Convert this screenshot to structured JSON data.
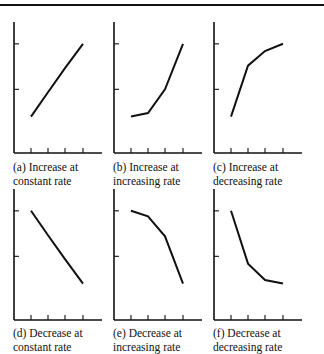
{
  "chart_data": [
    {
      "id": "a",
      "type": "line",
      "caption_line1": "(a) Increase at",
      "caption_line2": "constant rate",
      "x": [
        1,
        2,
        3,
        4
      ],
      "values": [
        1.0,
        1.67,
        2.33,
        3.0
      ],
      "ylim": [
        0,
        3.6
      ],
      "title": "",
      "xlabel": "",
      "ylabel": "",
      "grid": false
    },
    {
      "id": "b",
      "type": "line",
      "caption_line1": "(b) Increase at",
      "caption_line2": "increasing rate",
      "x": [
        1,
        2,
        3,
        4
      ],
      "values": [
        1.0,
        1.1,
        1.75,
        3.0
      ],
      "ylim": [
        0,
        3.6
      ],
      "title": "",
      "xlabel": "",
      "ylabel": "",
      "grid": false
    },
    {
      "id": "c",
      "type": "line",
      "caption_line1": "(c) Increase at",
      "caption_line2": "decreasing rate",
      "x": [
        1,
        2,
        3,
        4
      ],
      "values": [
        1.0,
        2.4,
        2.8,
        3.0
      ],
      "ylim": [
        0,
        3.6
      ],
      "title": "",
      "xlabel": "",
      "ylabel": "",
      "grid": false
    },
    {
      "id": "d",
      "type": "line",
      "caption_line1": "(d) Decrease at",
      "caption_line2": "constant rate",
      "x": [
        1,
        2,
        3,
        4
      ],
      "values": [
        3.0,
        2.33,
        1.67,
        1.0
      ],
      "ylim": [
        0,
        3.6
      ],
      "title": "",
      "xlabel": "",
      "ylabel": "",
      "grid": false
    },
    {
      "id": "e",
      "type": "line",
      "caption_line1": "(e) Decrease at",
      "caption_line2": "increasing rate",
      "x": [
        1,
        2,
        3,
        4
      ],
      "values": [
        3.0,
        2.85,
        2.3,
        1.0
      ],
      "ylim": [
        0,
        3.6
      ],
      "title": "",
      "xlabel": "",
      "ylabel": "",
      "grid": false
    },
    {
      "id": "f",
      "type": "line",
      "caption_line1": "(f) Decrease at",
      "caption_line2": "decreasing rate",
      "x": [
        1,
        2,
        3,
        4
      ],
      "values": [
        3.0,
        1.55,
        1.1,
        1.0
      ],
      "ylim": [
        0,
        3.6
      ],
      "title": "",
      "xlabel": "",
      "ylabel": "",
      "grid": false
    }
  ],
  "layout": {
    "panels": [
      {
        "ox": 14,
        "oy": 153
      },
      {
        "ox": 114,
        "oy": 153
      },
      {
        "ox": 214,
        "oy": 153
      },
      {
        "ox": 14,
        "oy": 320
      },
      {
        "ox": 114,
        "oy": 320
      },
      {
        "ox": 214,
        "oy": 320
      }
    ],
    "axis_height": 131,
    "axis_width": 88,
    "x_ticks_px": [
      17,
      34,
      51,
      69
    ],
    "y_tick_levels": [
      1.75,
      3.0
    ],
    "tick_len": 5,
    "stroke": "#111111"
  }
}
